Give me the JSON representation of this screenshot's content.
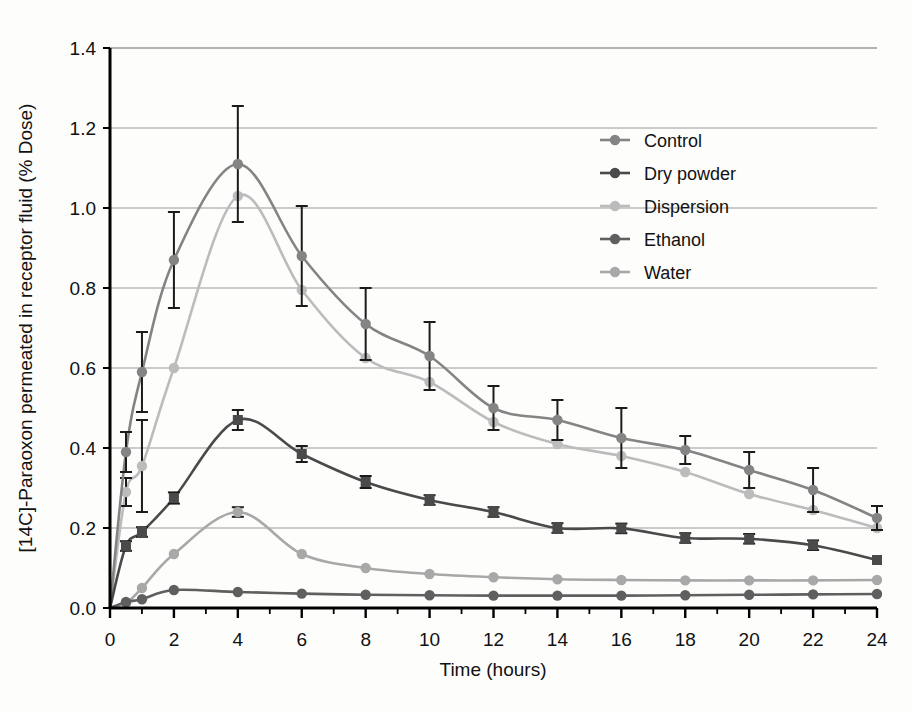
{
  "chart_data": {
    "type": "line",
    "title": "",
    "xlabel": "Time (hours)",
    "ylabel": "[14C]-Paraoxon permeated in receptor fluid (% Dose)",
    "xlim": [
      0,
      24
    ],
    "ylim": [
      0.0,
      1.4
    ],
    "ytick_step": 0.2,
    "xtick_step": 2,
    "x_minor_tick_step": 1,
    "grid": "horizontal",
    "legend_position": "top-right-inside",
    "xticks": [
      "0",
      "2",
      "4",
      "6",
      "8",
      "10",
      "12",
      "14",
      "16",
      "18",
      "20",
      "22",
      "24"
    ],
    "yticks": [
      "0.0",
      "0.2",
      "0.4",
      "0.6",
      "0.8",
      "1.0",
      "1.2",
      "1.4"
    ],
    "x": [
      0,
      0.5,
      1,
      2,
      4,
      6,
      8,
      10,
      12,
      14,
      16,
      18,
      20,
      22,
      24
    ],
    "series": [
      {
        "name": "Control",
        "color": "#848484",
        "marker": "circle",
        "values": [
          0.0,
          0.39,
          0.59,
          0.87,
          1.11,
          0.88,
          0.71,
          0.63,
          0.5,
          0.47,
          0.425,
          0.395,
          0.345,
          0.295,
          0.225
        ],
        "errors": [
          0.0,
          0.05,
          0.1,
          0.12,
          0.145,
          0.125,
          0.09,
          0.085,
          0.055,
          0.05,
          0.075,
          0.035,
          0.045,
          0.055,
          0.03
        ]
      },
      {
        "name": "Dry powder",
        "color": "#4a4a4a",
        "marker": "square",
        "values": [
          0.0,
          0.155,
          0.19,
          0.275,
          0.47,
          0.385,
          0.315,
          0.27,
          0.24,
          0.2,
          0.199,
          0.175,
          0.173,
          0.157,
          0.12
        ],
        "errors": [
          0.0,
          0.012,
          0.012,
          0.014,
          0.025,
          0.02,
          0.015,
          0.012,
          0.012,
          0.012,
          0.012,
          0.012,
          0.012,
          0.012,
          0.0
        ]
      },
      {
        "name": "Dispersion",
        "color": "#bcbcbc",
        "marker": "circle",
        "values": [
          0.0,
          0.29,
          0.355,
          0.6,
          1.03,
          0.795,
          0.625,
          0.565,
          0.465,
          0.41,
          0.38,
          0.34,
          0.285,
          0.245,
          0.2
        ],
        "errors": [
          0.0,
          0.035,
          0.115,
          0.0,
          0.0,
          0.0,
          0.0,
          0.0,
          0.0,
          0.0,
          0.0,
          0.0,
          0.0,
          0.0,
          0.0
        ]
      },
      {
        "name": "Ethanol",
        "color": "#5f5f5f",
        "marker": "circle",
        "values": [
          0.0,
          0.015,
          0.022,
          0.045,
          0.04,
          0.036,
          0.033,
          0.032,
          0.031,
          0.031,
          0.031,
          0.032,
          0.033,
          0.034,
          0.035
        ],
        "errors": [
          0.0,
          0.0,
          0.0,
          0.0,
          0.0,
          0.0,
          0.0,
          0.0,
          0.0,
          0.0,
          0.0,
          0.0,
          0.0,
          0.0,
          0.0
        ]
      },
      {
        "name": "Water",
        "color": "#a8a8a8",
        "marker": "circle",
        "values": [
          0.0,
          0.012,
          0.05,
          0.135,
          0.24,
          0.135,
          0.1,
          0.085,
          0.077,
          0.072,
          0.07,
          0.069,
          0.069,
          0.069,
          0.07
        ],
        "errors": [
          0.0,
          0.0,
          0.0,
          0.0,
          0.012,
          0.0,
          0.0,
          0.0,
          0.0,
          0.0,
          0.0,
          0.0,
          0.0,
          0.0,
          0.0
        ]
      }
    ]
  },
  "legend": {
    "items": [
      {
        "label": "Control",
        "color": "#848484"
      },
      {
        "label": "Dry powder",
        "color": "#4a4a4a"
      },
      {
        "label": "Dispersion",
        "color": "#bcbcbc"
      },
      {
        "label": "Ethanol",
        "color": "#5f5f5f"
      },
      {
        "label": "Water",
        "color": "#a8a8a8"
      }
    ]
  },
  "axes": {
    "x_title": "Time (hours)",
    "y_title": "[14C]-Paraoxon permeated in receptor fluid (% Dose)"
  },
  "colors": {
    "axis": "#000000",
    "grid": "#9a9a9a",
    "error_bar": "#1b1b1b",
    "background": "#fdfdfc"
  }
}
